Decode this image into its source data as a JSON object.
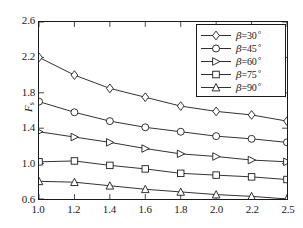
{
  "chart_data": {
    "type": "line",
    "title": "",
    "xlabel": "",
    "ylabel": "F_s",
    "ylabel_main": "F",
    "ylabel_sub": "s",
    "x": [
      1.0,
      1.2,
      1.4,
      1.6,
      1.8,
      2.0,
      2.2,
      2.5
    ],
    "xtick_labels": [
      "1.0",
      "1.2",
      "1.4",
      "1.6",
      "1.8",
      "2.0",
      "2.2",
      "2.5"
    ],
    "ytick_labels": [
      "0.6",
      "1.0",
      "1.4",
      "1.8",
      "2.2",
      "2.6"
    ],
    "ytick_values": [
      0.6,
      1.0,
      1.4,
      1.8,
      2.2,
      2.6
    ],
    "ylim": [
      0.6,
      2.6
    ],
    "grid": false,
    "legend_position": "top-right",
    "line_color": "#1a1a1a",
    "marker_fill": "#ffffff",
    "series": [
      {
        "name": "β=30°",
        "marker": "diamond",
        "values": [
          2.2,
          2.0,
          1.85,
          1.75,
          1.65,
          1.59,
          1.55,
          1.48
        ]
      },
      {
        "name": "β=45°",
        "marker": "circle",
        "values": [
          1.7,
          1.58,
          1.48,
          1.41,
          1.36,
          1.31,
          1.28,
          1.24
        ]
      },
      {
        "name": "β=60°",
        "marker": "triangle-right",
        "values": [
          1.36,
          1.3,
          1.24,
          1.17,
          1.11,
          1.08,
          1.04,
          1.02
        ]
      },
      {
        "name": "β=75°",
        "marker": "square",
        "values": [
          1.02,
          1.03,
          0.98,
          0.94,
          0.89,
          0.87,
          0.85,
          0.82
        ]
      },
      {
        "name": "β=90°",
        "marker": "triangle-up",
        "values": [
          0.8,
          0.79,
          0.75,
          0.71,
          0.68,
          0.65,
          0.63,
          0.6
        ]
      }
    ]
  },
  "legend": {
    "entries": [
      {
        "symbol": "β",
        "text": "=30",
        "degree": "°",
        "marker": "diamond"
      },
      {
        "symbol": "β",
        "text": "=45",
        "degree": "°",
        "marker": "circle"
      },
      {
        "symbol": "β",
        "text": "=60",
        "degree": "°",
        "marker": "triangle-right"
      },
      {
        "symbol": "β",
        "text": "=75",
        "degree": "°",
        "marker": "square"
      },
      {
        "symbol": "β",
        "text": "=90",
        "degree": "°",
        "marker": "triangle-up"
      }
    ]
  }
}
